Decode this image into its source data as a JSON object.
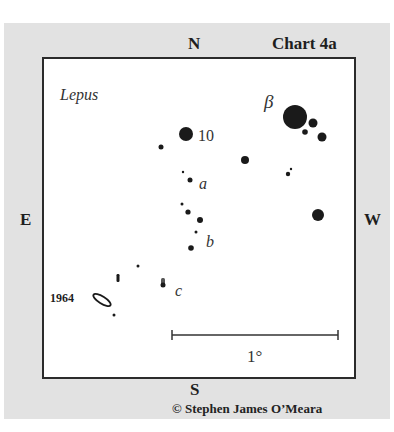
{
  "chart": {
    "title": "Chart 4a",
    "constellation": "Lepus",
    "directions": {
      "north": "N",
      "south": "S",
      "east": "E",
      "west": "W"
    },
    "scale_label": "1°",
    "credit": "© Stephen James O’Meara"
  },
  "colors": {
    "panel": "#e2e2e2",
    "frame": "#2b2b2b",
    "star": "#1a1a1a",
    "background": "#ffffff"
  },
  "chart_data": {
    "type": "scatter",
    "title": "Chart 4a",
    "subtitle": "Lepus",
    "orientation": {
      "top": "N",
      "bottom": "S",
      "left": "E",
      "right": "W"
    },
    "scale_bar": {
      "label": "1°",
      "x1": 172,
      "x2": 338,
      "y": 335
    },
    "stars": [
      {
        "x": 295,
        "y": 117,
        "r": 12,
        "label": "β"
      },
      {
        "x": 313,
        "y": 123,
        "r": 4.5
      },
      {
        "x": 305,
        "y": 132,
        "r": 2.8
      },
      {
        "x": 322,
        "y": 137,
        "r": 4.5
      },
      {
        "x": 186,
        "y": 134,
        "r": 7,
        "label": "10"
      },
      {
        "x": 161,
        "y": 147,
        "r": 2.5
      },
      {
        "x": 245,
        "y": 160,
        "r": 4
      },
      {
        "x": 288,
        "y": 174,
        "r": 2.2
      },
      {
        "x": 291,
        "y": 169,
        "r": 1.2
      },
      {
        "x": 183,
        "y": 172,
        "r": 1.2
      },
      {
        "x": 190,
        "y": 180,
        "r": 2.5,
        "label": "a"
      },
      {
        "x": 318,
        "y": 215,
        "r": 6
      },
      {
        "x": 182,
        "y": 204,
        "r": 1.5
      },
      {
        "x": 188,
        "y": 212,
        "r": 2.6
      },
      {
        "x": 200,
        "y": 220,
        "r": 3
      },
      {
        "x": 196,
        "y": 232,
        "r": 1.5
      },
      {
        "x": 191,
        "y": 248,
        "r": 2.8,
        "label": "b"
      },
      {
        "x": 138,
        "y": 266,
        "r": 1.5
      },
      {
        "x": 114,
        "y": 315,
        "r": 1.5
      }
    ],
    "objects": [
      {
        "type": "elongated-mark",
        "x": 118,
        "y": 278
      },
      {
        "type": "smudge",
        "x": 163,
        "y": 283,
        "label": "c"
      },
      {
        "type": "ellipse",
        "x": 102,
        "y": 300,
        "rx": 10,
        "ry": 3.5,
        "angle": 32,
        "label": "1964"
      }
    ],
    "labels": [
      {
        "text": "β",
        "x": 264,
        "y": 108,
        "style": "italic"
      },
      {
        "text": "10",
        "x": 198,
        "y": 141,
        "style": "plain"
      },
      {
        "text": "a",
        "x": 199,
        "y": 189,
        "style": "italic"
      },
      {
        "text": "b",
        "x": 206,
        "y": 247,
        "style": "italic"
      },
      {
        "text": "c",
        "x": 175,
        "y": 296,
        "style": "italic"
      },
      {
        "text": "1964",
        "x": 50,
        "y": 302,
        "style": "bold"
      }
    ]
  }
}
